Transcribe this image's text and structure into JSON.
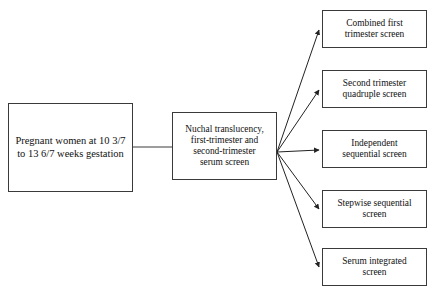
{
  "diagram": {
    "type": "flowchart",
    "background_color": "#ffffff",
    "line_color": "#3a3a3a",
    "text_color": "#111111",
    "nodes": {
      "start": {
        "id": "start",
        "label": "Pregnant women at 10 3/7\nto 13 6/7 weeks gestation",
        "shape": "rectangle"
      },
      "screen": {
        "id": "screen",
        "label": "Nuchal translucency,\nfirst-trimester and\nsecond-trimester\nserum screen",
        "shape": "rectangle"
      },
      "outcomes": [
        {
          "id": "combined-first-trimester",
          "label": "Combined first\ntrimester screen",
          "shape": "rectangle"
        },
        {
          "id": "second-trimester-quadruple",
          "label": "Second trimester\nquadruple screen",
          "shape": "rectangle"
        },
        {
          "id": "independent-sequential",
          "label": "Independent\nsequential screen",
          "shape": "rectangle"
        },
        {
          "id": "stepwise-sequential",
          "label": "Stepwise sequential\nscreen",
          "shape": "rectangle"
        },
        {
          "id": "serum-integrated",
          "label": "Serum integrated\nscreen",
          "shape": "rectangle"
        }
      ]
    },
    "edges": [
      {
        "id": "start-to-screen",
        "from": "start",
        "to": "screen",
        "arrowhead": false,
        "style": "straight"
      },
      {
        "id": "screen-to-combined-first-trimester",
        "from": "screen",
        "to": "combined-first-trimester",
        "arrowhead": true,
        "style": "straight"
      },
      {
        "id": "screen-to-second-trimester-quadruple",
        "from": "screen",
        "to": "second-trimester-quadruple",
        "arrowhead": true,
        "style": "straight"
      },
      {
        "id": "screen-to-independent-sequential",
        "from": "screen",
        "to": "independent-sequential",
        "arrowhead": true,
        "style": "straight"
      },
      {
        "id": "screen-to-stepwise-sequential",
        "from": "screen",
        "to": "stepwise-sequential",
        "arrowhead": true,
        "style": "straight"
      },
      {
        "id": "screen-to-serum-integrated",
        "from": "screen",
        "to": "serum-integrated",
        "arrowhead": true,
        "style": "straight"
      }
    ]
  }
}
